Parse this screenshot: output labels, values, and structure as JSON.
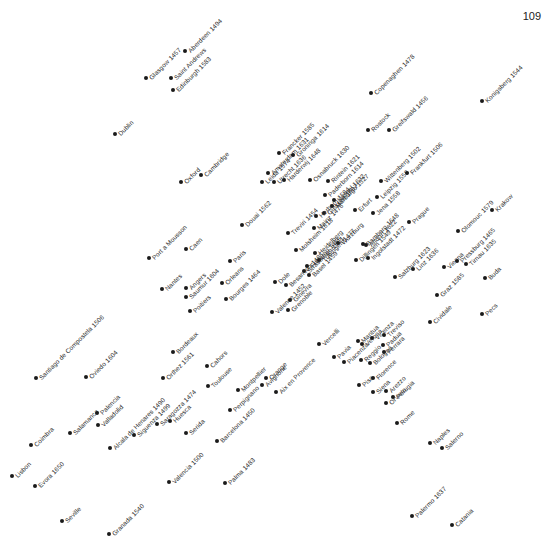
{
  "page_number": "109",
  "map": {
    "title": "",
    "dot_color": "#1a1a1a",
    "label_rotation_deg": -45,
    "places": [
      {
        "name": "Glasgow 1457",
        "x": 146,
        "y": 78
      },
      {
        "name": "Aberdeen 1494",
        "x": 185,
        "y": 51
      },
      {
        "name": "Saint Andrews",
        "x": 171,
        "y": 78
      },
      {
        "name": "Edinburgh 1583",
        "x": 173,
        "y": 90
      },
      {
        "name": "Dublin",
        "x": 115,
        "y": 134
      },
      {
        "name": "Oxford",
        "x": 181,
        "y": 182
      },
      {
        "name": "Cambridge",
        "x": 201,
        "y": 175
      },
      {
        "name": "Copenaghen 1478",
        "x": 371,
        "y": 93
      },
      {
        "name": "Rostock",
        "x": 368,
        "y": 130
      },
      {
        "name": "Greifswald 1456",
        "x": 389,
        "y": 130
      },
      {
        "name": "Konigsberg 1544",
        "x": 482,
        "y": 101
      },
      {
        "name": "Francker 1585",
        "x": 279,
        "y": 153
      },
      {
        "name": "Amsterdam 1631",
        "x": 268,
        "y": 173
      },
      {
        "name": "Groninga 1614",
        "x": 293,
        "y": 155
      },
      {
        "name": "Harderwij 1648",
        "x": 284,
        "y": 180
      },
      {
        "name": "Leida 1574",
        "x": 262,
        "y": 182
      },
      {
        "name": "Utrecht 1636",
        "x": 274,
        "y": 182
      },
      {
        "name": "Douai 1562",
        "x": 242,
        "y": 225
      },
      {
        "name": "Osnabruck 1630",
        "x": 310,
        "y": 180
      },
      {
        "name": "Rintein 1621",
        "x": 328,
        "y": 181
      },
      {
        "name": "Paderborn 1614",
        "x": 325,
        "y": 195
      },
      {
        "name": "Kassel 1632",
        "x": 334,
        "y": 200
      },
      {
        "name": "Marburgo 1527",
        "x": 332,
        "y": 206
      },
      {
        "name": "Giessen 1607",
        "x": 324,
        "y": 213
      },
      {
        "name": "Erfurt",
        "x": 355,
        "y": 210
      },
      {
        "name": "Wittenberg 1502",
        "x": 381,
        "y": 181
      },
      {
        "name": "Leipzig 1558",
        "x": 377,
        "y": 197
      },
      {
        "name": "Jena 1558",
        "x": 373,
        "y": 213
      },
      {
        "name": "Frankfurt 1506",
        "x": 407,
        "y": 173
      },
      {
        "name": "Treviri 1454",
        "x": 288,
        "y": 233
      },
      {
        "name": "Herborn 1584",
        "x": 316,
        "y": 216
      },
      {
        "name": "Mainz 1476",
        "x": 314,
        "y": 228
      },
      {
        "name": "Molsheim 1618",
        "x": 296,
        "y": 250
      },
      {
        "name": "Heidelberg",
        "x": 315,
        "y": 253
      },
      {
        "name": "Wurzburg",
        "x": 338,
        "y": 243
      },
      {
        "name": "Bamberg 1648",
        "x": 363,
        "y": 244
      },
      {
        "name": "Tubingen 1477",
        "x": 319,
        "y": 260
      },
      {
        "name": "Friburgo 1455",
        "x": 307,
        "y": 266
      },
      {
        "name": "Altdorf 1622",
        "x": 366,
        "y": 245
      },
      {
        "name": "Ingolstadt 1472",
        "x": 368,
        "y": 258
      },
      {
        "name": "Prague",
        "x": 409,
        "y": 222
      },
      {
        "name": "Dillingen 1549",
        "x": 356,
        "y": 260
      },
      {
        "name": "Basel 1459",
        "x": 309,
        "y": 275
      },
      {
        "name": "Strasburgo 1621",
        "x": 304,
        "y": 271
      },
      {
        "name": "Besancon 1485",
        "x": 286,
        "y": 285
      },
      {
        "name": "Dole",
        "x": 275,
        "y": 282
      },
      {
        "name": "Ginevra",
        "x": 290,
        "y": 300
      },
      {
        "name": "Grenoble",
        "x": 288,
        "y": 310
      },
      {
        "name": "Valence 1452",
        "x": 272,
        "y": 312
      },
      {
        "name": "Salzburg 1623",
        "x": 395,
        "y": 277
      },
      {
        "name": "Linz 1636",
        "x": 413,
        "y": 269
      },
      {
        "name": "Olomouc 1579",
        "x": 458,
        "y": 231
      },
      {
        "name": "Krakow",
        "x": 492,
        "y": 210
      },
      {
        "name": "Vienna",
        "x": 444,
        "y": 267
      },
      {
        "name": "Pressburg 1465",
        "x": 457,
        "y": 261
      },
      {
        "name": "Tirnau 1635",
        "x": 466,
        "y": 264
      },
      {
        "name": "Buda",
        "x": 485,
        "y": 278
      },
      {
        "name": "Graz 1585",
        "x": 437,
        "y": 295
      },
      {
        "name": "Cividale",
        "x": 430,
        "y": 322
      },
      {
        "name": "Pecs",
        "x": 482,
        "y": 314
      },
      {
        "name": "Port a Mousson",
        "x": 149,
        "y": 258
      },
      {
        "name": "Caen",
        "x": 186,
        "y": 249
      },
      {
        "name": "Paris",
        "x": 230,
        "y": 261
      },
      {
        "name": "Nantes",
        "x": 162,
        "y": 289
      },
      {
        "name": "Angers",
        "x": 186,
        "y": 288
      },
      {
        "name": "Saumur 1604",
        "x": 186,
        "y": 297
      },
      {
        "name": "Orleans",
        "x": 222,
        "y": 283
      },
      {
        "name": "Bourges 1464",
        "x": 226,
        "y": 299
      },
      {
        "name": "Poitiers",
        "x": 190,
        "y": 311
      },
      {
        "name": "Bordeaux",
        "x": 173,
        "y": 352
      },
      {
        "name": "Orthez 1561",
        "x": 163,
        "y": 378
      },
      {
        "name": "Cahors",
        "x": 207,
        "y": 366
      },
      {
        "name": "Toulouse",
        "x": 208,
        "y": 386
      },
      {
        "name": "Montpellier",
        "x": 238,
        "y": 390
      },
      {
        "name": "Perpignano",
        "x": 230,
        "y": 410
      },
      {
        "name": "Orange",
        "x": 266,
        "y": 378
      },
      {
        "name": "Avignone",
        "x": 262,
        "y": 385
      },
      {
        "name": "Aix en Provence",
        "x": 276,
        "y": 392
      },
      {
        "name": "Vercelli",
        "x": 319,
        "y": 344
      },
      {
        "name": "Pavia",
        "x": 334,
        "y": 357
      },
      {
        "name": "Piacenza",
        "x": 344,
        "y": 362
      },
      {
        "name": "Mantua",
        "x": 358,
        "y": 341
      },
      {
        "name": "Verona",
        "x": 362,
        "y": 344
      },
      {
        "name": "Vicenza",
        "x": 372,
        "y": 338
      },
      {
        "name": "Treviso",
        "x": 384,
        "y": 335
      },
      {
        "name": "Padua",
        "x": 383,
        "y": 345
      },
      {
        "name": "Ferrara",
        "x": 384,
        "y": 352
      },
      {
        "name": "Reggio",
        "x": 361,
        "y": 360
      },
      {
        "name": "Bologna",
        "x": 370,
        "y": 363
      },
      {
        "name": "Pisa",
        "x": 359,
        "y": 385
      },
      {
        "name": "Florence",
        "x": 373,
        "y": 378
      },
      {
        "name": "Siena",
        "x": 373,
        "y": 392
      },
      {
        "name": "Arezzo",
        "x": 386,
        "y": 391
      },
      {
        "name": "Orvieto",
        "x": 386,
        "y": 403
      },
      {
        "name": "Perugia",
        "x": 393,
        "y": 397
      },
      {
        "name": "Rome",
        "x": 397,
        "y": 423
      },
      {
        "name": "Naples",
        "x": 430,
        "y": 443
      },
      {
        "name": "Salerno",
        "x": 442,
        "y": 448
      },
      {
        "name": "Palermo 1637",
        "x": 412,
        "y": 516
      },
      {
        "name": "Catania",
        "x": 452,
        "y": 525
      },
      {
        "name": "Santiago de Compostela 1506",
        "x": 36,
        "y": 378
      },
      {
        "name": "Oviedo 1604",
        "x": 86,
        "y": 377
      },
      {
        "name": "Salamanca",
        "x": 70,
        "y": 433
      },
      {
        "name": "Palencia",
        "x": 97,
        "y": 413
      },
      {
        "name": "Valladolid",
        "x": 98,
        "y": 425
      },
      {
        "name": "Alcala de Henares 1490",
        "x": 110,
        "y": 448
      },
      {
        "name": "Siguenza 1499",
        "x": 134,
        "y": 435
      },
      {
        "name": "Saragozza 1474",
        "x": 157,
        "y": 424
      },
      {
        "name": "Huesca",
        "x": 170,
        "y": 421
      },
      {
        "name": "Serida",
        "x": 186,
        "y": 433
      },
      {
        "name": "Barcelona 1450",
        "x": 217,
        "y": 441
      },
      {
        "name": "Coimbra",
        "x": 31,
        "y": 445
      },
      {
        "name": "Lisbon",
        "x": 12,
        "y": 476
      },
      {
        "name": "Evora 1650",
        "x": 35,
        "y": 486
      },
      {
        "name": "Valencia 1500",
        "x": 169,
        "y": 482
      },
      {
        "name": "Palma 1483",
        "x": 225,
        "y": 483
      },
      {
        "name": "Seville",
        "x": 62,
        "y": 521
      },
      {
        "name": "Granada 1540",
        "x": 109,
        "y": 534
      }
    ]
  }
}
